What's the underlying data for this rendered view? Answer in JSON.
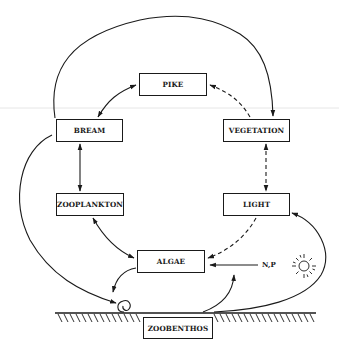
{
  "diagram": {
    "type": "lake ecosystem interaction diagram",
    "nodes": {
      "pike": "PIKE",
      "bream": "BREAM",
      "vegetation": "VEGETATION",
      "zooplankton": "ZOOPLANKTON",
      "light": "LIGHT",
      "algae": "ALGAE",
      "zoobenthos": "ZOOBENTHOS"
    },
    "inputs": {
      "nutrients": "N,P",
      "sun_icon": "sun-icon"
    },
    "edges": [
      {
        "from": "bream",
        "to": "pike",
        "style": "solid",
        "direction": "both"
      },
      {
        "from": "vegetation",
        "to": "pike",
        "style": "dashed",
        "direction": "to-pike"
      },
      {
        "from": "bream",
        "to": "vegetation",
        "style": "solid",
        "direction": "to-vegetation",
        "route": "arc over top"
      },
      {
        "from": "bream",
        "to": "zooplankton",
        "style": "solid",
        "direction": "both"
      },
      {
        "from": "vegetation",
        "to": "light",
        "style": "dashed",
        "direction": "both"
      },
      {
        "from": "zooplankton",
        "to": "algae",
        "style": "solid",
        "direction": "both"
      },
      {
        "from": "algae",
        "to": "light",
        "style": "dashed",
        "direction": "to-algae"
      },
      {
        "from": "nutrients",
        "to": "algae",
        "style": "solid",
        "direction": "to-algae"
      },
      {
        "from": "bream",
        "to": "sediment",
        "style": "solid",
        "direction": "to-sediment"
      },
      {
        "from": "algae",
        "to": "sediment",
        "style": "solid",
        "direction": "to-sediment"
      },
      {
        "from": "zoobenthos",
        "to": "nutrients",
        "style": "solid",
        "direction": "upward"
      },
      {
        "from": "zoobenthos",
        "to": "light",
        "style": "solid",
        "direction": "to-light",
        "route": "arc around sun"
      }
    ],
    "colors": {
      "ink": "#1a1a1a",
      "background": "#ffffff"
    }
  }
}
